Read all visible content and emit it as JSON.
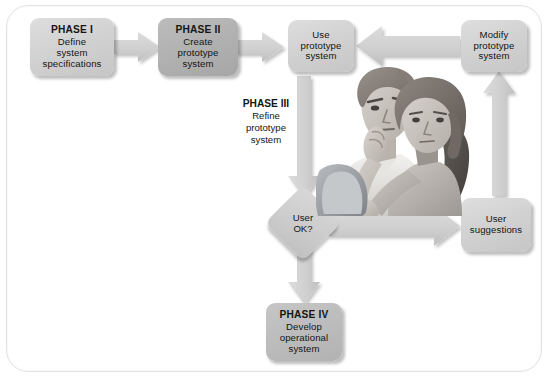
{
  "diagram": {
    "frame_color": "#e3e3e3",
    "node_fill_light": "#d2d2d2",
    "node_fill_mid": "#bdbdbd",
    "node_fill_dark": "#b2b2b2",
    "arrow_fill": "#d2d2d2",
    "text_color": "#151515"
  },
  "nodes": {
    "phase1": {
      "title": "PHASE I",
      "lines": [
        "Define",
        "system",
        "specifications"
      ]
    },
    "phase2": {
      "title": "PHASE II",
      "lines": [
        "Create",
        "prototype",
        "system"
      ]
    },
    "use_prototype": {
      "title": "",
      "lines": [
        "Use",
        "prototype",
        "system"
      ]
    },
    "modify_prototype": {
      "title": "",
      "lines": [
        "Modify",
        "prototype",
        "system"
      ]
    },
    "user_suggestions": {
      "title": "",
      "lines": [
        "User",
        "suggestions"
      ]
    },
    "phase4": {
      "title": "PHASE IV",
      "lines": [
        "Develop",
        "operational",
        "system"
      ]
    }
  },
  "decision": {
    "lines": [
      "User",
      "OK?"
    ]
  },
  "phase3_caption": {
    "title": "PHASE III",
    "lines": [
      "Refine",
      "prototype",
      "system"
    ]
  },
  "illustration": {
    "name": "two-users-at-monitor",
    "description": "Two people reviewing a computer monitor"
  }
}
